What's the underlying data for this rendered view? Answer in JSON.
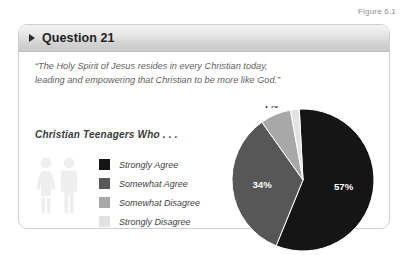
{
  "figure": {
    "label": "Figure 6.1"
  },
  "card": {
    "header": {
      "bullet_icon": "triangle-right-icon",
      "title": "Question 21"
    },
    "quote": "“The Holy Spirit of Jesus resides in every Christian today, leading and empowering that Christian to be more like God.”",
    "subheading": "Christian Teenagers Who . . .",
    "pictograms": {
      "female_icon": "female-figure-icon",
      "male_icon": "male-figure-icon",
      "color": "#eeeeee"
    }
  },
  "legend": [
    {
      "label": "Strongly Agree",
      "color": "#151515"
    },
    {
      "label": "Somewhat Agree",
      "color": "#575757"
    },
    {
      "label": "Somewhat Disagree",
      "color": "#a8a8a8"
    },
    {
      "label": "Strongly Disagree",
      "color": "#e2e2e2"
    }
  ],
  "chart_data": {
    "type": "pie",
    "title": "Christian Teenagers Who . . .",
    "categories": [
      "Strongly Agree",
      "Somewhat Agree",
      "Somewhat Disagree",
      "Strongly Disagree"
    ],
    "values": [
      57,
      34,
      7,
      2
    ],
    "value_labels": [
      "57%",
      "34%",
      "7%",
      "2%"
    ],
    "colors": [
      "#151515",
      "#575757",
      "#a8a8a8",
      "#e2e2e2"
    ],
    "units": "percent",
    "start_angle_deg": -3,
    "legend_position": "left",
    "grid": false,
    "xlabel": "",
    "ylabel": ""
  }
}
